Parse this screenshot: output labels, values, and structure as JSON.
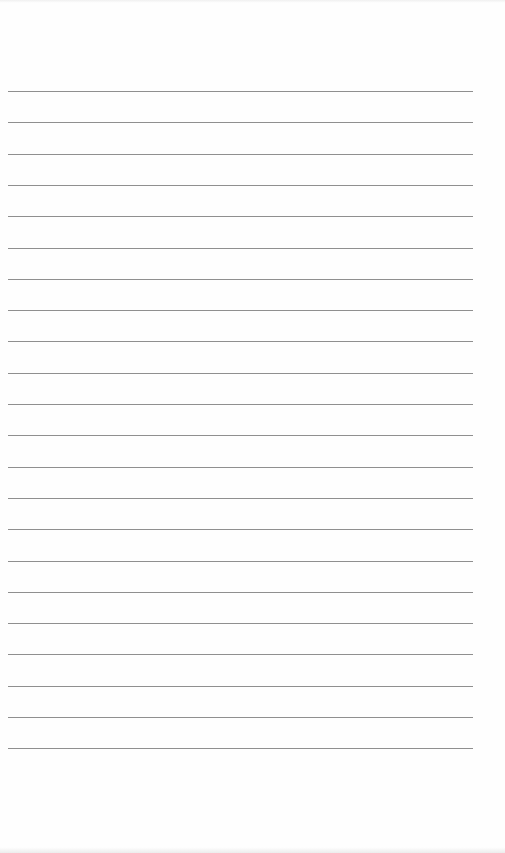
{
  "page": {
    "type": "lined-paper",
    "background": "#fefefe",
    "rule_color": "#8f8f8f",
    "rule_count": 22,
    "rule_start_y": 91,
    "rule_spacing": 31.3,
    "rule_left": 8,
    "rule_width": 465,
    "text": []
  }
}
